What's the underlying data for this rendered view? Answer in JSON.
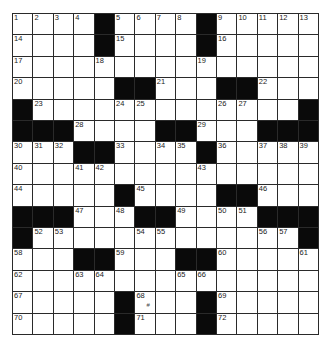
{
  "puzzle": {
    "rows": 15,
    "cols": 15,
    "grid": [
      "....#....#.....",
      "....#....#.....",
      "...............",
      ".....##...##...",
      "#.............#",
      "###....##...###",
      "...##....#.....",
      "...............",
      ".....#....##...",
      "###...##....###",
      "#.............#",
      "...##...##.....",
      "...............",
      ".....#...#.....",
      ".....#...#....."
    ],
    "numbers": [
      [
        1,
        0,
        0
      ],
      [
        2,
        0,
        1
      ],
      [
        3,
        0,
        2
      ],
      [
        4,
        0,
        3
      ],
      [
        5,
        0,
        5
      ],
      [
        6,
        0,
        6
      ],
      [
        7,
        0,
        7
      ],
      [
        8,
        0,
        8
      ],
      [
        9,
        0,
        10
      ],
      [
        10,
        0,
        11
      ],
      [
        11,
        0,
        12
      ],
      [
        12,
        0,
        13
      ],
      [
        13,
        0,
        14
      ],
      [
        14,
        1,
        0
      ],
      [
        15,
        1,
        5
      ],
      [
        16,
        1,
        10
      ],
      [
        17,
        2,
        0
      ],
      [
        18,
        2,
        4
      ],
      [
        19,
        2,
        9
      ],
      [
        20,
        3,
        0
      ],
      [
        21,
        3,
        7
      ],
      [
        22,
        3,
        12
      ],
      [
        23,
        4,
        1
      ],
      [
        24,
        4,
        5
      ],
      [
        25,
        4,
        6
      ],
      [
        26,
        4,
        10
      ],
      [
        27,
        4,
        11
      ],
      [
        28,
        5,
        3
      ],
      [
        29,
        5,
        9
      ],
      [
        30,
        6,
        0
      ],
      [
        31,
        6,
        1
      ],
      [
        32,
        6,
        2
      ],
      [
        33,
        6,
        5
      ],
      [
        34,
        6,
        7
      ],
      [
        35,
        6,
        8
      ],
      [
        36,
        6,
        10
      ],
      [
        37,
        6,
        12
      ],
      [
        38,
        6,
        13
      ],
      [
        39,
        6,
        14
      ],
      [
        40,
        7,
        0
      ],
      [
        41,
        7,
        3
      ],
      [
        42,
        7,
        4
      ],
      [
        43,
        7,
        9
      ],
      [
        44,
        8,
        0
      ],
      [
        45,
        8,
        6
      ],
      [
        46,
        8,
        12
      ],
      [
        47,
        9,
        3
      ],
      [
        48,
        9,
        5
      ],
      [
        49,
        9,
        8
      ],
      [
        50,
        9,
        10
      ],
      [
        51,
        9,
        11
      ],
      [
        52,
        10,
        1
      ],
      [
        53,
        10,
        2
      ],
      [
        54,
        10,
        6
      ],
      [
        55,
        10,
        7
      ],
      [
        56,
        10,
        12
      ],
      [
        57,
        10,
        13
      ],
      [
        58,
        11,
        0
      ],
      [
        59,
        11,
        5
      ],
      [
        60,
        11,
        10
      ],
      [
        61,
        11,
        14
      ],
      [
        62,
        12,
        0
      ],
      [
        63,
        12,
        3
      ],
      [
        64,
        12,
        4
      ],
      [
        65,
        12,
        8
      ],
      [
        66,
        12,
        9
      ],
      [
        67,
        13,
        0
      ],
      [
        68,
        13,
        6
      ],
      [
        69,
        13,
        10
      ],
      [
        70,
        14,
        0
      ],
      [
        71,
        14,
        6
      ],
      [
        72,
        14,
        10
      ]
    ],
    "stray_marks": [
      {
        "row": 13,
        "col": 6,
        "glyph": "#"
      }
    ]
  }
}
